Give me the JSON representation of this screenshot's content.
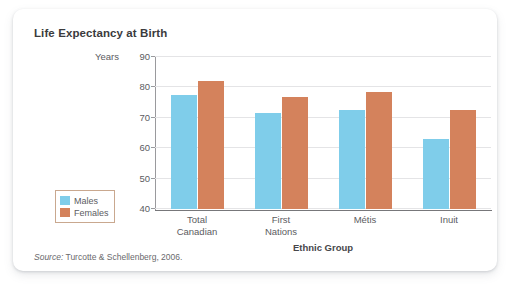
{
  "figure": {
    "title": "Life Expectancy at Birth",
    "source_prefix": "Source:",
    "source_citation": "Turcotte & Schellenberg, 2006."
  },
  "chart_data": {
    "type": "bar",
    "title": "Life Expectancy at Birth",
    "xlabel": "Ethnic Group",
    "ylabel": "Years",
    "ylim": [
      40,
      90
    ],
    "yticks": [
      40,
      50,
      60,
      70,
      80,
      90
    ],
    "grid": true,
    "legend_position": "left-lower",
    "categories": [
      "Total Canadian",
      "First Nations",
      "Métis",
      "Inuit"
    ],
    "category_lines": [
      [
        "Total",
        "Canadian"
      ],
      [
        "First",
        "Nations"
      ],
      [
        "Métis"
      ],
      [
        "Inuit"
      ]
    ],
    "series": [
      {
        "name": "Males",
        "color": "#7fcdea",
        "values": [
          77.5,
          71.5,
          72.5,
          63.0
        ]
      },
      {
        "name": "Females",
        "color": "#d4825c",
        "values": [
          82.0,
          77.0,
          78.5,
          72.5
        ]
      }
    ]
  }
}
